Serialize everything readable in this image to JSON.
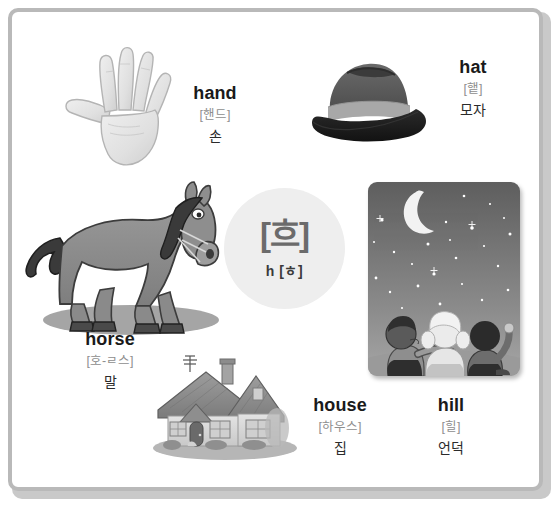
{
  "poster": {
    "letter": {
      "display": "[흐]",
      "glyph": "ㅎ",
      "romanization": "h [ㅎ]",
      "circle_color": "#eeeeee",
      "glyph_color": "#6b6b6b"
    },
    "frame_color": "#b9b9b9",
    "background_color": "#ffffff"
  },
  "words": [
    {
      "id": "hand",
      "english": "hand",
      "pronunciation": "[핸드]",
      "korean": "손",
      "illustration": "hand-illustration"
    },
    {
      "id": "hat",
      "english": "hat",
      "pronunciation": "[햍]",
      "korean": "모자",
      "illustration": "hat-illustration"
    },
    {
      "id": "horse",
      "english": "horse",
      "pronunciation": "[호-ㄹ스]",
      "korean": "말",
      "illustration": "horse-illustration"
    },
    {
      "id": "house",
      "english": "house",
      "pronunciation": "[하우스]",
      "korean": "집",
      "illustration": "house-illustration"
    },
    {
      "id": "hill",
      "english": "hill",
      "pronunciation": "[힐]",
      "korean": "언덕",
      "illustration": "hill-illustration"
    }
  ]
}
